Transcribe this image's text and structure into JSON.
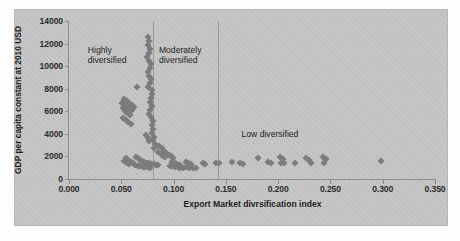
{
  "figure": {
    "background_color": "#c9c9c9",
    "marker_color": "#7c7c7c",
    "axis_color": "#8d8d8d"
  },
  "chart_data": {
    "type": "scatter",
    "title": "",
    "xlabel": "Export Market divrsification index",
    "ylabel": "GDP per capita constant at 2010 USD",
    "xlim": [
      0.0,
      0.35
    ],
    "ylim": [
      0,
      14000
    ],
    "xticks": [
      0.0,
      0.05,
      0.1,
      0.15,
      0.2,
      0.25,
      0.3,
      0.35
    ],
    "xtick_labels": [
      "0.000",
      "0.050",
      "0.100",
      "0.150",
      "0.200",
      "0.250",
      "0.300",
      "0.350"
    ],
    "yticks": [
      0,
      2000,
      4000,
      6000,
      8000,
      10000,
      12000,
      14000
    ],
    "ytick_labels": [
      "0",
      "2000",
      "4000",
      "6000",
      "8000",
      "10000",
      "12000",
      "14000"
    ],
    "grid": false,
    "legend": "none",
    "annotations": [
      {
        "text": "Highly\ndiversified",
        "x": 0.018,
        "y": 11900
      },
      {
        "text": "Moderately\ndiversified",
        "x": 0.086,
        "y": 11900
      },
      {
        "text": "Low diversified",
        "x": 0.165,
        "y": 4450
      }
    ],
    "dividers": [
      0.0805,
      0.1425
    ],
    "marker": "diamond",
    "points": [
      [
        0.0755,
        12600
      ],
      [
        0.0765,
        12250
      ],
      [
        0.0752,
        11900
      ],
      [
        0.0773,
        11550
      ],
      [
        0.0768,
        11200
      ],
      [
        0.0748,
        10850
      ],
      [
        0.0762,
        10500
      ],
      [
        0.078,
        10200
      ],
      [
        0.0772,
        9850
      ],
      [
        0.0755,
        9500
      ],
      [
        0.0768,
        9150
      ],
      [
        0.0783,
        8850
      ],
      [
        0.0775,
        8500
      ],
      [
        0.076,
        8150
      ],
      [
        0.079,
        7850
      ],
      [
        0.0648,
        8150
      ],
      [
        0.0795,
        7500
      ],
      [
        0.0782,
        7150
      ],
      [
        0.077,
        6800
      ],
      [
        0.079,
        6500
      ],
      [
        0.0778,
        6150
      ],
      [
        0.0765,
        5800
      ],
      [
        0.053,
        7100
      ],
      [
        0.0552,
        6900
      ],
      [
        0.0575,
        6720
      ],
      [
        0.0598,
        6540
      ],
      [
        0.051,
        6750
      ],
      [
        0.0532,
        6560
      ],
      [
        0.0555,
        6390
      ],
      [
        0.0578,
        6210
      ],
      [
        0.062,
        6350
      ],
      [
        0.06,
        6100
      ],
      [
        0.0512,
        6250
      ],
      [
        0.0535,
        6050
      ],
      [
        0.0558,
        5880
      ],
      [
        0.0582,
        5700
      ],
      [
        0.052,
        5420
      ],
      [
        0.0545,
        5230
      ],
      [
        0.0568,
        5050
      ],
      [
        0.059,
        4870
      ],
      [
        0.0788,
        5450
      ],
      [
        0.0802,
        5100
      ],
      [
        0.0792,
        4750
      ],
      [
        0.0808,
        4420
      ],
      [
        0.0798,
        4080
      ],
      [
        0.0815,
        3760
      ],
      [
        0.0805,
        3420
      ],
      [
        0.0822,
        3120
      ],
      [
        0.0812,
        2790
      ],
      [
        0.0735,
        3900
      ],
      [
        0.0752,
        3620
      ],
      [
        0.0768,
        3350
      ],
      [
        0.0862,
        2950
      ],
      [
        0.0885,
        2720
      ],
      [
        0.0908,
        2520
      ],
      [
        0.093,
        2320
      ],
      [
        0.0952,
        2150
      ],
      [
        0.0975,
        2000
      ],
      [
        0.0998,
        1860
      ],
      [
        0.0852,
        2400
      ],
      [
        0.0875,
        2230
      ],
      [
        0.0898,
        2080
      ],
      [
        0.092,
        1940
      ],
      [
        0.064,
        1980
      ],
      [
        0.066,
        1850
      ],
      [
        0.068,
        1720
      ],
      [
        0.07,
        1620
      ],
      [
        0.072,
        1520
      ],
      [
        0.0742,
        1450
      ],
      [
        0.0765,
        1380
      ],
      [
        0.0788,
        1330
      ],
      [
        0.081,
        1290
      ],
      [
        0.0832,
        1250
      ],
      [
        0.0855,
        1210
      ],
      [
        0.0548,
        1820
      ],
      [
        0.0568,
        1640
      ],
      [
        0.059,
        1490
      ],
      [
        0.0612,
        1380
      ],
      [
        0.053,
        1560
      ],
      [
        0.0552,
        1400
      ],
      [
        0.0575,
        1290
      ],
      [
        0.0635,
        1230
      ],
      [
        0.0658,
        1170
      ],
      [
        0.0682,
        1120
      ],
      [
        0.0705,
        1080
      ],
      [
        0.0728,
        1050
      ],
      [
        0.0752,
        1020
      ],
      [
        0.0775,
        1000
      ],
      [
        0.0985,
        1520
      ],
      [
        0.101,
        1420
      ],
      [
        0.1035,
        1340
      ],
      [
        0.1058,
        1280
      ],
      [
        0.0962,
        1180
      ],
      [
        0.0988,
        1120
      ],
      [
        0.1012,
        1080
      ],
      [
        0.1038,
        1040
      ],
      [
        0.1062,
        1010
      ],
      [
        0.1088,
        980
      ],
      [
        0.1115,
        1480
      ],
      [
        0.1142,
        1400
      ],
      [
        0.1168,
        1350
      ],
      [
        0.112,
        1050
      ],
      [
        0.1148,
        1010
      ],
      [
        0.1278,
        1420
      ],
      [
        0.1305,
        1360
      ],
      [
        0.119,
        980
      ],
      [
        0.1215,
        950
      ],
      [
        0.1402,
        1450
      ],
      [
        0.143,
        1400
      ],
      [
        0.156,
        1480
      ],
      [
        0.1635,
        1380
      ],
      [
        0.166,
        1350
      ],
      [
        0.1812,
        1900
      ],
      [
        0.1905,
        1480
      ],
      [
        0.1932,
        1430
      ],
      [
        0.2015,
        1950
      ],
      [
        0.2042,
        1780
      ],
      [
        0.2028,
        1450
      ],
      [
        0.206,
        1400
      ],
      [
        0.216,
        1420
      ],
      [
        0.2268,
        1880
      ],
      [
        0.2292,
        1700
      ],
      [
        0.231,
        1400
      ],
      [
        0.243,
        1930
      ],
      [
        0.2455,
        1760
      ],
      [
        0.2442,
        1380
      ],
      [
        0.298,
        1580
      ]
    ]
  }
}
